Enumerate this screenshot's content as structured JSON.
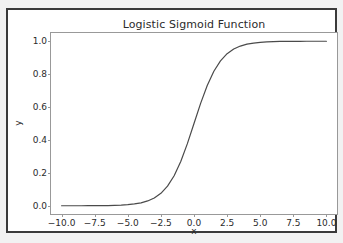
{
  "figure": {
    "background_color": "#f2f2f2",
    "frame_color": "#3a3a3a",
    "axes_background": "#ffffff"
  },
  "chart_data": {
    "type": "line",
    "title": "Logistic Sigmoid Function",
    "xlabel": "x",
    "ylabel": "y",
    "xlim": [
      -10.8,
      10.8
    ],
    "ylim": [
      -0.05,
      1.05
    ],
    "grid": false,
    "legend": null,
    "line_color": "#4a4a4a",
    "line_width": 1.2,
    "xticks": [
      -10.0,
      -7.5,
      -5.0,
      -2.5,
      0.0,
      2.5,
      5.0,
      7.5,
      10.0
    ],
    "xtick_labels": [
      "−10.0",
      "−7.5",
      "−5.0",
      "−2.5",
      "0.0",
      "2.5",
      "5.0",
      "7.5",
      "10.0"
    ],
    "yticks": [
      0.0,
      0.2,
      0.4,
      0.6,
      0.8,
      1.0
    ],
    "ytick_labels": [
      "0.0",
      "0.2",
      "0.4",
      "0.6",
      "0.8",
      "1.0"
    ],
    "series": [
      {
        "name": "sigmoid",
        "formula": "1 / (1 + exp(-x))",
        "x": [
          -10.0,
          -9.5,
          -9.0,
          -8.5,
          -8.0,
          -7.5,
          -7.0,
          -6.5,
          -6.0,
          -5.5,
          -5.0,
          -4.5,
          -4.0,
          -3.5,
          -3.0,
          -2.5,
          -2.0,
          -1.5,
          -1.0,
          -0.5,
          0.0,
          0.5,
          1.0,
          1.5,
          2.0,
          2.5,
          3.0,
          3.5,
          4.0,
          4.5,
          5.0,
          5.5,
          6.0,
          6.5,
          7.0,
          7.5,
          8.0,
          8.5,
          9.0,
          9.5,
          10.0
        ],
        "values": [
          4.54e-05,
          7.49e-05,
          0.0001234,
          0.0002035,
          0.0003354,
          0.0005527,
          0.0009111,
          0.0015011,
          0.0024726,
          0.0040702,
          0.0066929,
          0.0109869,
          0.0179862,
          0.0293122,
          0.0474259,
          0.0758582,
          0.1192029,
          0.1824255,
          0.2689414,
          0.3775407,
          0.5,
          0.6224593,
          0.7310586,
          0.8175745,
          0.8807971,
          0.9241418,
          0.9525741,
          0.9706878,
          0.9820138,
          0.9890131,
          0.9933071,
          0.9959298,
          0.9975274,
          0.9984989,
          0.9990889,
          0.9994473,
          0.9996646,
          0.9997965,
          0.9998766,
          0.9999251,
          0.9999546
        ]
      }
    ]
  }
}
